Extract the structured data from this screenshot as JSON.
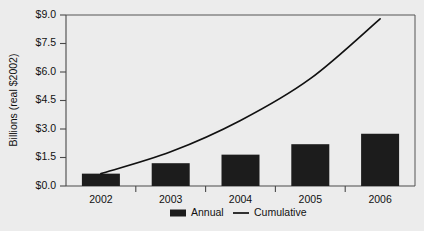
{
  "chart_data": {
    "type": "bar",
    "title": "",
    "subtitle": "",
    "xlabel": "",
    "ylabel": "Billions (real $2002)",
    "categories": [
      "2002",
      "2003",
      "2004",
      "2005",
      "2006"
    ],
    "ylim": [
      0.0,
      9.0
    ],
    "ytick_values": [
      0.0,
      1.5,
      3.0,
      4.5,
      6.0,
      7.5,
      9.0
    ],
    "ytick_labels": [
      "$0.0",
      "$1.5",
      "$3.0",
      "$4.5",
      "$6.0",
      "$7.5",
      "$9.0"
    ],
    "grid": false,
    "legend_position": "bottom-center",
    "series": [
      {
        "name": "Annual",
        "type": "bar",
        "color": "#1c1c1c",
        "values": [
          0.65,
          1.2,
          1.65,
          2.2,
          2.75
        ]
      },
      {
        "name": "Cumulative",
        "type": "line",
        "color": "#111111",
        "values": [
          0.65,
          1.8,
          3.45,
          5.65,
          8.8
        ]
      }
    ]
  },
  "axes": {
    "y_title": "Billions (real $2002)",
    "y_labels": [
      "$9.0",
      "$7.5",
      "$6.0",
      "$4.5",
      "$3.0",
      "$1.5",
      "$0.0"
    ],
    "x_labels": [
      "2002",
      "2003",
      "2004",
      "2005",
      "2006"
    ]
  },
  "legend": {
    "items": [
      {
        "label": "Annual",
        "marker": "bar-swatch-icon"
      },
      {
        "label": "Cumulative",
        "marker": "line-swatch-icon"
      }
    ]
  },
  "colors": {
    "background": "#ececec",
    "bar": "#1c1c1c",
    "line": "#111111",
    "axis": "#4a4a4a",
    "frame": "#555555",
    "text": "#111111"
  }
}
